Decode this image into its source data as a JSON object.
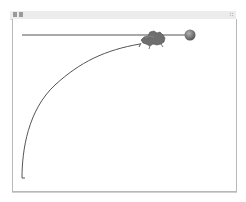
{
  "window": {
    "title_icons": [
      "app-icon",
      "settings-icon"
    ],
    "grip_icon": "resize-grip-icon"
  },
  "scene": {
    "description": "Physics simulation canvas: a ball on a horizontal rail with an animal-like figure and a descending curved track",
    "rail": {
      "x1": 22,
      "y1": 35,
      "x2": 188,
      "y2": 35,
      "color": "#8c8c8c"
    },
    "ball": {
      "cx": 190,
      "cy": 35,
      "r": 5.5,
      "color": "#7a7a7a"
    },
    "creature": {
      "cx": 153,
      "cy": 39,
      "color": "#6e6e6e"
    },
    "curve": {
      "start": [
        22,
        178
      ],
      "end": [
        140,
        44
      ],
      "color": "#555555"
    },
    "colors": {
      "frame_border": "#b8b8b8",
      "titlebar_bg": "#ececec",
      "canvas_bg": "#ffffff"
    }
  }
}
